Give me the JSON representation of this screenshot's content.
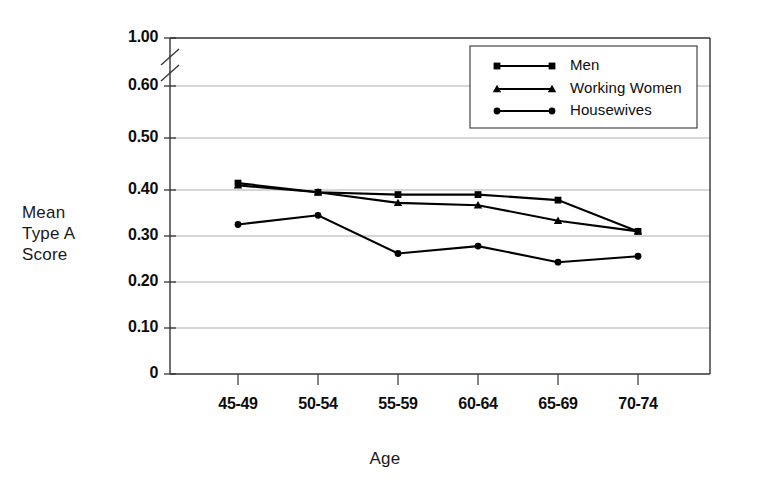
{
  "chart_data": {
    "type": "line",
    "title": "",
    "xlabel": "Age",
    "ylabel": "Mean Type A Score",
    "ylabel_lines": [
      "Mean",
      "Type A",
      "Score"
    ],
    "categories": [
      "45-49",
      "50-54",
      "55-59",
      "60-64",
      "65-69",
      "70-74"
    ],
    "yticks": [
      "0",
      "0.10",
      "0.20",
      "0.30",
      "0.40",
      "0.50",
      "0.60",
      "1.00"
    ],
    "ylim": [
      0,
      1.0
    ],
    "axis_break": true,
    "axis_break_between": [
      "0.60",
      "1.00"
    ],
    "grid": true,
    "legend_position": "top-right",
    "series": [
      {
        "name": "Men",
        "marker": "square",
        "values": [
          0.415,
          0.395,
          0.39,
          0.39,
          0.378,
          0.31
        ]
      },
      {
        "name": "Working Women",
        "marker": "triangle",
        "values": [
          0.41,
          0.395,
          0.372,
          0.367,
          0.333,
          0.31
        ]
      },
      {
        "name": "Housewives",
        "marker": "circle",
        "values": [
          0.325,
          0.345,
          0.262,
          0.278,
          0.243,
          0.256
        ]
      }
    ]
  },
  "legend": {
    "entries": [
      {
        "label": "Men"
      },
      {
        "label": "Working Women"
      },
      {
        "label": "Housewives"
      }
    ]
  },
  "colors": {
    "line": "#000000",
    "grid": "#9a9a9a",
    "axis": "#333333",
    "text": "#0d0d0d",
    "background": "#ffffff"
  }
}
